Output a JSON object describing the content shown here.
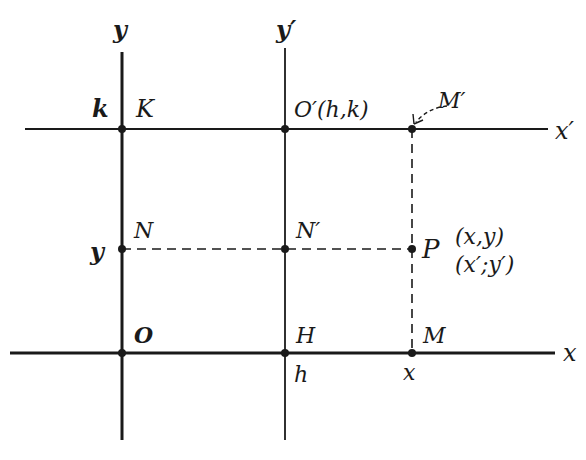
{
  "diagram": {
    "colors": {
      "ink": "#1a1a1a",
      "background": "#ffffff"
    },
    "axes": {
      "y_label": "y",
      "y_prime_label": "y′",
      "x_label": "x",
      "x_prime_label": "x′"
    },
    "points": {
      "O": "O",
      "K": "K",
      "N": "N",
      "H": "H",
      "O_prime": "O′(h,k)",
      "N_prime": "N′",
      "M": "M",
      "M_prime": "M′",
      "P": "P"
    },
    "coordinates": {
      "P_original": "(x,y)",
      "P_new": "(x′;y′)"
    },
    "ticks": {
      "k": "k",
      "y": "y",
      "h": "h",
      "x": "x"
    }
  }
}
